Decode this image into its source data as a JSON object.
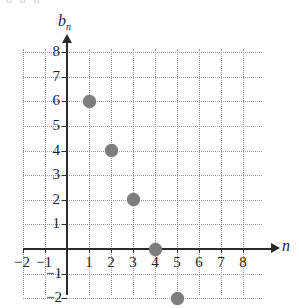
{
  "figure": {
    "top_bleed_text": "  a                   a             a",
    "background_color": "#ffffff"
  },
  "chart_data": {
    "type": "scatter",
    "title": "",
    "xlabel": "n",
    "ylabel": "b_n",
    "ylabel_base": "b",
    "ylabel_sub": "n",
    "x": [
      1,
      2,
      3,
      4,
      5
    ],
    "values": [
      6,
      4,
      2,
      0,
      -2
    ],
    "points": [
      {
        "x": 1,
        "y": 6
      },
      {
        "x": 2,
        "y": 4
      },
      {
        "x": 3,
        "y": 2
      },
      {
        "x": 4,
        "y": 0
      },
      {
        "x": 5,
        "y": -2
      }
    ],
    "xlim": [
      -2,
      8
    ],
    "ylim": [
      -2,
      8
    ],
    "xticks": [
      -2,
      -1,
      1,
      2,
      3,
      4,
      5,
      6,
      7,
      8
    ],
    "yticks": [
      8,
      7,
      6,
      5,
      4,
      3,
      2,
      1,
      -1,
      -2
    ],
    "xtick_labels": [
      "−2",
      "−1",
      "1",
      "2",
      "3",
      "4",
      "5",
      "6",
      "7",
      "8"
    ],
    "ytick_labels": [
      "8",
      "7",
      "6",
      "5",
      "4",
      "3",
      "2",
      "1",
      "−1",
      "−2"
    ],
    "grid": true,
    "grid_style": "dotted",
    "grid_color": "#9a9a9a",
    "legend": false,
    "marker_color": "#7d7d7d",
    "axis_color": "#2b2b2b"
  }
}
